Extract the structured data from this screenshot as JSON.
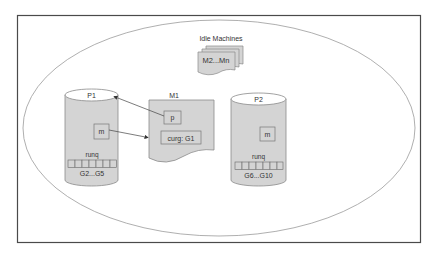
{
  "diagram": {
    "title": "",
    "colors": {
      "frame": "#4a4a4a",
      "ellipse": "#9a9a9a",
      "shape_fill": "#d4d4d4",
      "shape_stroke": "#8a8a8a",
      "text": "#333333",
      "arrow": "#444444"
    },
    "idle_machines": {
      "label": "Idle Machines",
      "stack_label": "M2...Mn"
    },
    "p1": {
      "label": "P1",
      "m_label": "m",
      "runq_label": "runq",
      "runq_slots": 7,
      "goroutines": "G2...G5"
    },
    "m1": {
      "label": "M1",
      "p_label": "p",
      "curg_label": "curg: G1"
    },
    "p2": {
      "label": "P2",
      "m_label": "m",
      "runq_label": "runq",
      "runq_slots": 7,
      "goroutines": "G6...G10"
    },
    "edges": [
      {
        "from": "m1.p",
        "to": "p1",
        "label": ""
      },
      {
        "from": "p1.m",
        "to": "m1",
        "label": ""
      }
    ]
  }
}
